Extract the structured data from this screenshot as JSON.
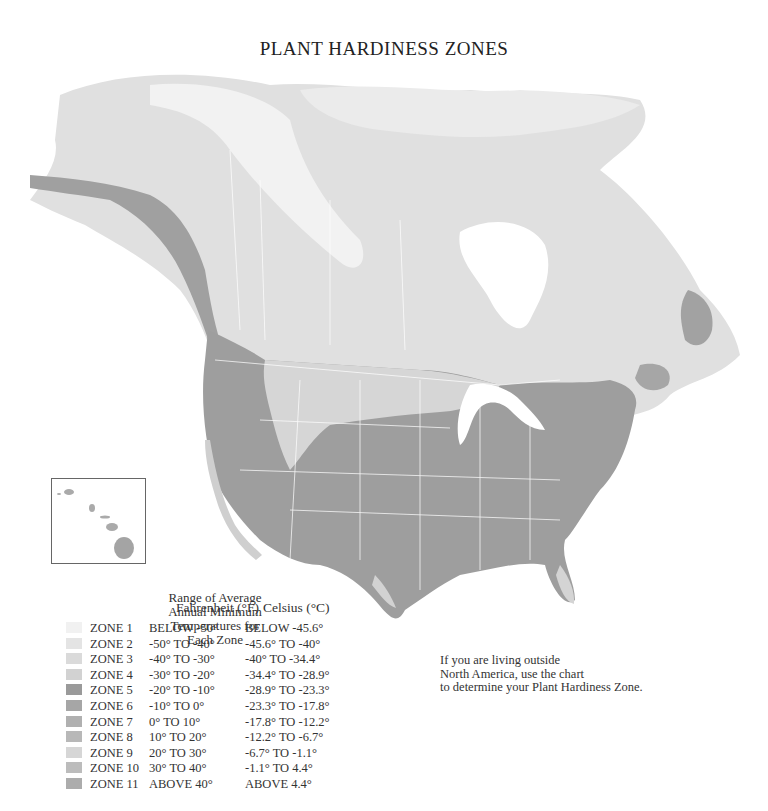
{
  "title": "PLANT HARDINESS ZONES",
  "range_title": [
    "Range of Average",
    "Annual Minimum",
    "Temperatures for",
    "Each Zone"
  ],
  "legend": {
    "header_fahrenheit": "Fahrenheit (°F)",
    "header_celsius": "Celsius (°C)",
    "zones": [
      {
        "zone": "ZONE 1",
        "fahrenheit": "BELOW -50°",
        "celsius": "BELOW -45.6°",
        "color": "#f1f1f1"
      },
      {
        "zone": "ZONE 2",
        "fahrenheit": "-50° TO -40°",
        "celsius": "-45.6° TO -40°",
        "color": "#e4e4e4"
      },
      {
        "zone": "ZONE 3",
        "fahrenheit": "-40° TO -30°",
        "celsius": "-40° TO -34.4°",
        "color": "#dadada"
      },
      {
        "zone": "ZONE 4",
        "fahrenheit": "-30° TO -20°",
        "celsius": "-34.4° TO -28.9°",
        "color": "#d2d2d2"
      },
      {
        "zone": "ZONE 5",
        "fahrenheit": "-20° TO -10°",
        "celsius": "-28.9° TO -23.3°",
        "color": "#9a9a9a"
      },
      {
        "zone": "ZONE 6",
        "fahrenheit": "-10° TO    0°",
        "celsius": "-23.3° TO -17.8°",
        "color": "#a6a6a6"
      },
      {
        "zone": "ZONE 7",
        "fahrenheit": "0° TO  10°",
        "celsius": "-17.8° TO -12.2°",
        "color": "#b0b0b0"
      },
      {
        "zone": "ZONE 8",
        "fahrenheit": "10° TO  20°",
        "celsius": "-12.2° TO -6.7°",
        "color": "#b8b8b8"
      },
      {
        "zone": "ZONE 9",
        "fahrenheit": "20° TO  30°",
        "celsius": "-6.7° TO -1.1°",
        "color": "#d6d6d6"
      },
      {
        "zone": "ZONE 10",
        "fahrenheit": "30° TO  40°",
        "celsius": "-1.1° TO 4.4°",
        "color": "#bcbcbc"
      },
      {
        "zone": "ZONE 11",
        "fahrenheit": "ABOVE 40°",
        "celsius": "ABOVE 4.4°",
        "color": "#acacac"
      }
    ]
  },
  "note": [
    "If you are living outside",
    "North America, use the chart",
    "to determine your Plant Hardiness Zone."
  ],
  "map": {
    "region": "North America",
    "inset": "Hawaii"
  }
}
